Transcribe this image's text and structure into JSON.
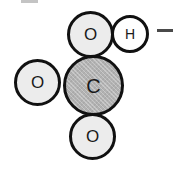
{
  "figure": {
    "name": "bicarbonate-anion-space-filling-model",
    "width": 192,
    "height": 170,
    "background_color": "#ffffff",
    "outline_color": "#111111",
    "label_color": "#1a1a1a"
  },
  "atoms": [
    {
      "id": "o-top",
      "label": "O",
      "element": "oxygen",
      "fill_color": "#ececec",
      "diameter": 47,
      "center_x": 90,
      "center_y": 34
    },
    {
      "id": "h-right",
      "label": "H",
      "element": "hydrogen",
      "fill_color": "#ffffff",
      "diameter": 38,
      "center_x": 130,
      "center_y": 34
    },
    {
      "id": "o-left",
      "label": "O",
      "element": "oxygen",
      "fill_color": "#ececec",
      "diameter": 47,
      "center_x": 37,
      "center_y": 82
    },
    {
      "id": "c-center",
      "label": "C",
      "element": "carbon",
      "fill_color": "#b2b2b2",
      "diameter": 61,
      "center_x": 93,
      "center_y": 85
    },
    {
      "id": "o-bottom",
      "label": "O",
      "element": "oxygen",
      "fill_color": "#ececec",
      "diameter": 47,
      "center_x": 92,
      "center_y": 136
    }
  ],
  "charge": {
    "label": "−",
    "name": "negative-charge",
    "color": "#4a4a4a"
  },
  "artifact": {
    "label": "",
    "color": "#3c3c3c"
  }
}
